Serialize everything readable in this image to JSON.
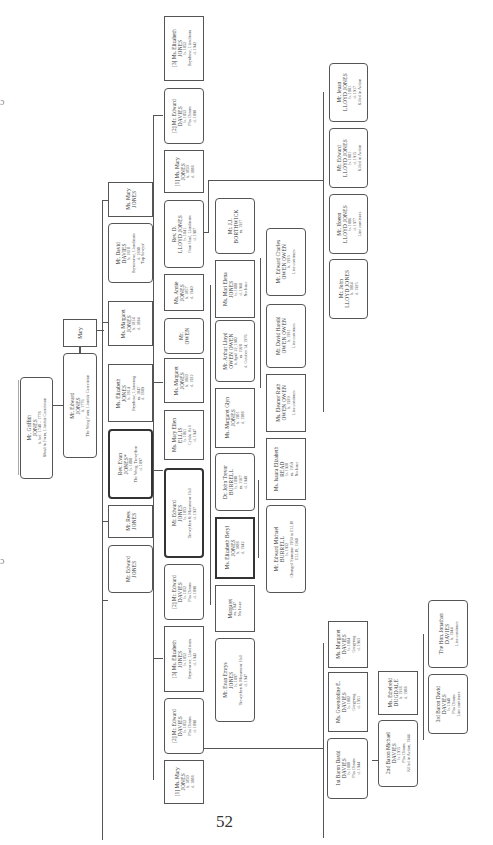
{
  "page": {
    "number": "52"
  },
  "edge_marks": [
    "ɔ",
    "ɔ"
  ],
  "people": [
    {
      "id": "griffith",
      "lines": [
        "Mr. Griffith",
        "JONES",
        "b. bef. 1748 – 1778",
        "Rhoslifu Farm, Llanfair Caereinion"
      ]
    },
    {
      "id": "edward_sr",
      "lines": [
        "Mr. Edward",
        "JONES",
        "b. 1776",
        "The Weeg Farm, Llanfair Caereinion"
      ]
    },
    {
      "id": "mary_sp",
      "lines": [
        "Mary"
      ]
    },
    {
      "id": "mary_jones_a",
      "lines": [
        "Ms. Mary",
        "JONES"
      ]
    },
    {
      "id": "david_davies",
      "lines": [
        "Mr. David",
        "DAVIES",
        "b. 1818",
        "Brynawrwe, Llandinam",
        "d. 1890",
        "'Top Sawyer'"
      ]
    },
    {
      "id": "margaret_1",
      "lines": [
        "Ms. Margaret",
        "JONES",
        "b. 1814",
        "d. 1894"
      ]
    },
    {
      "id": "elizabeth_1",
      "lines": [
        "Ms. Elizabeth",
        "JONES",
        "b. 1814",
        "Brynhose, Llanwnog",
        "m. 1847",
        "d. 1889"
      ]
    },
    {
      "id": "evan",
      "lines": [
        "Rev. Evan",
        "JONES*",
        "b. 1808",
        "The Weeg, Trewythen",
        "d. 1897"
      ]
    },
    {
      "id": "rees",
      "lines": [
        "Mr. Rees",
        "JONES"
      ]
    },
    {
      "id": "edward_2",
      "lines": [
        "Mr. Edward",
        "JONES"
      ]
    },
    {
      "id": "eliz_3",
      "lines": [
        "[3] Ms. Elizabeth",
        "JONES",
        "b. 1852",
        "Brynhose, Llandinam",
        "d. 1942"
      ]
    },
    {
      "id": "edward_davies_2a",
      "lines": [
        "[2] Mr. Edward",
        "DAVIES",
        "b. 1852",
        "Plas Dinam",
        "d. 1898"
      ]
    },
    {
      "id": "mary_1a",
      "lines": [
        "[1] Ms. Mary",
        "JONES",
        "b. 1850",
        "d. 1888"
      ]
    },
    {
      "id": "d_lloyd",
      "lines": [
        "Rev. D.",
        "LLOYD JONES",
        "b. 1841",
        "Fron Haul, Llandinam",
        "d. 1907"
      ]
    },
    {
      "id": "annie",
      "lines": [
        "Ms. Annie",
        "JONES",
        "b. 1857",
        "d. 1940"
      ]
    },
    {
      "id": "owen",
      "lines": [
        "Mr.",
        "OWEN"
      ]
    },
    {
      "id": "margaret_2",
      "lines": [
        "Ms. Margaret",
        "JONES",
        "b. 1860",
        "d. 1922"
      ]
    },
    {
      "id": "mary_ellis",
      "lines": [
        "Ms. Mary Ellen",
        "ELLIS",
        "b. 1861",
        "Cyfalu Hall",
        "d. 1947"
      ]
    },
    {
      "id": "edward_3",
      "lines": [
        "Mr. Edward",
        "JONES",
        "b. 1853",
        "Trewythen & Maesmawr Hall",
        "d. 1937"
      ]
    },
    {
      "id": "edward_davies_2b",
      "lines": [
        "[2] Mr. Edward",
        "DAVIES",
        "b. 1852",
        "Plas Dinam",
        "d. 1898"
      ]
    },
    {
      "id": "eliz_3b",
      "lines": [
        "[3] Ms. Elizabeth",
        "JONES",
        "b. 1852",
        "Brynawrwe, Llandinam",
        "d. 1942"
      ]
    },
    {
      "id": "edward_davies_2c",
      "lines": [
        "[2] Mr. Edward",
        "DAVIES",
        "b. 1852",
        "Plas Dinam",
        "d. 1898"
      ]
    },
    {
      "id": "mary_1b",
      "lines": [
        "[1] Ms. Mary",
        "JONES",
        "b. 1850",
        "d. 1888"
      ]
    },
    {
      "id": "borthwick",
      "lines": [
        "Mr. J.J.",
        "BORTHWICK",
        "m. 1917"
      ]
    },
    {
      "id": "mari_elena",
      "lines": [
        "Ms. Mari Elena",
        "JONES",
        "b. 1888",
        "d. 1968",
        "No Issue"
      ]
    },
    {
      "id": "arthur",
      "lines": [
        "Mr. Arthur Lloyd",
        "OWEN OWEN",
        "b. April 22, 1902",
        "m. 1928",
        "d. October 14, 1976"
      ]
    },
    {
      "id": "margaret_glyn",
      "lines": [
        "Ms. Margaret Glyn",
        "JONES",
        "b. 1901",
        "d. 1988"
      ]
    },
    {
      "id": "burrell",
      "lines": [
        "Dr. John Trevor",
        "BURRELL",
        "b. 1890",
        "m. 1927",
        "d. 1948"
      ]
    },
    {
      "id": "eliz_beryl",
      "lines": [
        "Ms. Elizabeth Beryl",
        "JONES",
        "b. 1888",
        "d. 1942"
      ]
    },
    {
      "id": "margaret_3",
      "lines": [
        "Margaret",
        "m. 1947",
        "No Issue"
      ]
    },
    {
      "id": "evan_emrys",
      "lines": [
        "Mr. Evan Emrys",
        "JONES",
        "b. 1897",
        "Trewythen & Maesmawr Hall",
        "d. 1947"
      ]
    },
    {
      "id": "edward_charles",
      "lines": [
        "Mr. Edward Charles",
        "OWEN OWEN",
        "b. 1933",
        "Line continues"
      ]
    },
    {
      "id": "david_harold",
      "lines": [
        "Mr. David Harold",
        "OWEN OWEN",
        "b. 1931",
        "Line continues"
      ]
    },
    {
      "id": "eleanor",
      "lines": [
        "Ms. Eleanor Ruth",
        "OWEN OWEN",
        "b. 1929",
        "Line continues"
      ]
    },
    {
      "id": "isaura",
      "lines": [
        "Ms. Isaura Elizabeth",
        "READ",
        "b. 1928",
        "m. 1959",
        "No Issue"
      ]
    },
    {
      "id": "edward_michael",
      "lines": [
        "Mr. Edward Michael",
        "BURRELL",
        "b. 1932",
        "Changed Surname 1959 to ELLIS",
        "ELLIS, 1960"
      ]
    },
    {
      "id": "ieuan",
      "lines": [
        "Mr. Ieuan",
        "LLOYD JONES",
        "b. 1881",
        "d. 1917",
        "Killed in Action"
      ]
    },
    {
      "id": "edward_lj",
      "lines": [
        "Mr. Edward",
        "LLOYD JONES",
        "b. 1881",
        "d. 1915",
        "Killed in Action"
      ]
    },
    {
      "id": "ifoeon",
      "lines": [
        "Mr. Ifoeon",
        "LLOYD JONES",
        "b. 1886",
        "d. 1977",
        "Line continues"
      ]
    },
    {
      "id": "john_lj",
      "lines": [
        "Mr. John",
        "LLOYD JONES",
        "b. 1884",
        "d. 1925"
      ]
    },
    {
      "id": "eliz_3c",
      "lines": [
        "[3] Ms. Elizabeth",
        "JONES",
        "b. 1852",
        "Brynawrwe, Llandinam",
        "d. 1942"
      ]
    },
    {
      "id": "edward_davies_2d",
      "lines": [
        "[2] Mr. Edward",
        "DAVIES",
        "b. 1852",
        "Plas Dinam",
        "d. 1898"
      ]
    },
    {
      "id": "mary_1c",
      "lines": [
        "[1] Ms. Mary",
        "JONES",
        "b. 1850",
        "d. 1888"
      ]
    },
    {
      "id": "margaret_davies",
      "lines": [
        "Ms. Margaret",
        "DAVIES",
        "b. 1884",
        "Gregynog",
        "d. 1963"
      ]
    },
    {
      "id": "gwendoline",
      "lines": [
        "Ms. Gwendoline E.",
        "DAVIES",
        "b. 1882",
        "Gregynog",
        "d. 1951"
      ]
    },
    {
      "id": "baron1",
      "lines": [
        "1st Baron David",
        "DAVIES",
        "b. 1880",
        "Plas Dinam",
        "d. 1944"
      ]
    },
    {
      "id": "dugdale",
      "lines": [
        "Ms. Ethelreld",
        "DUGDALE",
        "b. 1918",
        "d. 1988"
      ]
    },
    {
      "id": "baron2",
      "lines": [
        "2nd Baron Michael",
        "DAVIES",
        "b. 1915",
        "Plas Dinam",
        "Killed in Action, 1944"
      ]
    },
    {
      "id": "jonathan",
      "lines": [
        "The Hon. Jonathan",
        "DAVIES",
        "b. 1944",
        "Line continues"
      ]
    },
    {
      "id": "baron3",
      "lines": [
        "3rd Baron David",
        "DAVIES",
        "b. 1940",
        "Plas Dinam",
        "Line continues"
      ]
    }
  ]
}
